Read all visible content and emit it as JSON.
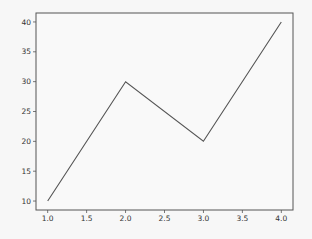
{
  "chart_data": {
    "type": "line",
    "title": "",
    "xlabel": "",
    "ylabel": "",
    "x": [
      1.0,
      2.0,
      3.0,
      4.0
    ],
    "series": [
      {
        "name": "",
        "values": [
          10,
          30,
          20,
          40
        ],
        "color": "#555555"
      }
    ],
    "xlim": [
      0.85,
      4.15
    ],
    "ylim": [
      8.5,
      41.5
    ],
    "xticks": [
      "1.0",
      "1.5",
      "2.0",
      "2.5",
      "3.0",
      "3.5",
      "4.0"
    ],
    "yticks": [
      "10",
      "15",
      "20",
      "25",
      "30",
      "35",
      "40"
    ],
    "grid": false,
    "legend": null
  },
  "colors": {
    "background": "#f7f7f7",
    "axes": "#555555",
    "line": "#555555",
    "text": "#333333"
  }
}
